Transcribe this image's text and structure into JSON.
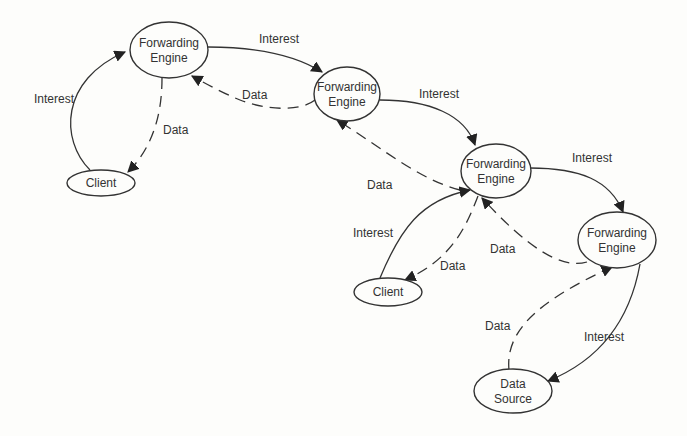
{
  "diagram": {
    "type": "network-flow",
    "nodes": [
      {
        "id": "fe1",
        "line1": "Forwarding",
        "line2": "Engine"
      },
      {
        "id": "fe2",
        "line1": "Forwarding",
        "line2": "Engine"
      },
      {
        "id": "fe3",
        "line1": "Forwarding",
        "line2": "Engine"
      },
      {
        "id": "fe4",
        "line1": "Forwarding",
        "line2": "Engine"
      },
      {
        "id": "client1",
        "line1": "Client"
      },
      {
        "id": "client2",
        "line1": "Client"
      },
      {
        "id": "source",
        "line1": "Data",
        "line2": "Source"
      }
    ],
    "edges": [
      {
        "from": "client1",
        "to": "fe1",
        "label": "Interest",
        "style": "solid"
      },
      {
        "from": "fe1",
        "to": "client1",
        "label": "Data",
        "style": "dashed"
      },
      {
        "from": "fe1",
        "to": "fe2",
        "label": "Interest",
        "style": "solid"
      },
      {
        "from": "fe2",
        "to": "fe1",
        "label": "Data",
        "style": "dashed"
      },
      {
        "from": "fe2",
        "to": "fe3",
        "label": "Interest",
        "style": "solid"
      },
      {
        "from": "fe3",
        "to": "fe2",
        "label": "Data",
        "style": "dashed"
      },
      {
        "from": "client2",
        "to": "fe3",
        "label": "Interest",
        "style": "solid"
      },
      {
        "from": "fe3",
        "to": "client2",
        "label": "Data",
        "style": "dashed"
      },
      {
        "from": "fe3",
        "to": "fe4",
        "label": "Interest",
        "style": "solid"
      },
      {
        "from": "fe4",
        "to": "fe3",
        "label": "Data",
        "style": "dashed"
      },
      {
        "from": "fe4",
        "to": "source",
        "label": "Interest",
        "style": "solid"
      },
      {
        "from": "source",
        "to": "fe4",
        "label": "Data",
        "style": "dashed"
      }
    ]
  }
}
